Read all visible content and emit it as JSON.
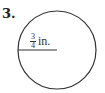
{
  "problem": {
    "number": "3.",
    "shape": "circle",
    "radius_label": {
      "numerator": "3",
      "denominator": "4",
      "unit": "in."
    },
    "colors": {
      "stroke": "#333333",
      "background": "#ffffff"
    }
  }
}
